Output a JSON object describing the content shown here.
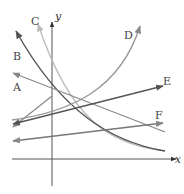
{
  "figure": {
    "axes": {
      "x_label": "x",
      "y_label": "y"
    },
    "curves": [
      {
        "id": "A",
        "label": "A",
        "kind": "line",
        "color": "#8a8a8a"
      },
      {
        "id": "B",
        "label": "B",
        "kind": "exponential-decay",
        "color": "#555555"
      },
      {
        "id": "C",
        "label": "C",
        "kind": "exponential-decay",
        "color": "#bbbbbb"
      },
      {
        "id": "D",
        "label": "D",
        "kind": "exponential-growth",
        "color": "#999999"
      },
      {
        "id": "E",
        "label": "E",
        "kind": "line",
        "color": "#555555"
      },
      {
        "id": "F",
        "label": "F",
        "kind": "line",
        "color": "#777777"
      }
    ]
  }
}
